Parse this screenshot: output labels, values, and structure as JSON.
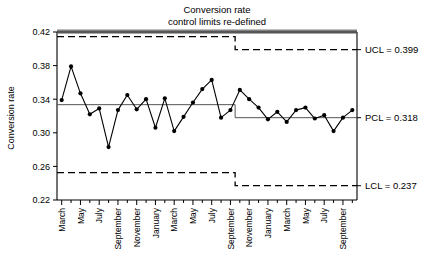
{
  "chart_data": {
    "type": "line",
    "title": "Conversion rate",
    "subtitle": "control limits re-defined",
    "xlabel": "",
    "ylabel": "Conversion rate",
    "ylim": [
      0.22,
      0.42
    ],
    "yticks": [
      0.42,
      0.38,
      0.34,
      0.3,
      0.26,
      0.22
    ],
    "ytick_labels": [
      "0.42",
      "0.38",
      "0.34",
      "0.30",
      "0.26",
      "0.22"
    ],
    "grid": false,
    "legend": "none",
    "x_tick_labels": [
      "March",
      "May",
      "July",
      "September",
      "November",
      "January",
      "March",
      "May",
      "July",
      "September",
      "November",
      "January",
      "March",
      "May",
      "July",
      "September"
    ],
    "x_label_indices": [
      0,
      2,
      4,
      6,
      8,
      10,
      12,
      14,
      16,
      18,
      20,
      22,
      24,
      26,
      28,
      30
    ],
    "n_points": 32,
    "values": [
      0.339,
      0.379,
      0.347,
      0.322,
      0.329,
      0.283,
      0.327,
      0.345,
      0.328,
      0.34,
      0.306,
      0.341,
      0.302,
      0.319,
      0.336,
      0.352,
      0.363,
      0.318,
      0.327,
      0.351,
      0.34,
      0.33,
      0.316,
      0.325,
      0.313,
      0.327,
      0.33,
      0.317,
      0.321,
      0.302,
      0.318,
      0.327
    ],
    "annotations": [
      {
        "name": "ucl",
        "label": "UCL = 0.399",
        "value": 0.399
      },
      {
        "name": "pcl",
        "label": "PCL = 0.318",
        "value": 0.318
      },
      {
        "name": "lcl",
        "label": "LCL = 0.237",
        "value": 0.237
      }
    ],
    "control_phases": [
      {
        "name": "phase-1",
        "start_index": 0,
        "end_index": 19,
        "ucl": 0.4145,
        "pcl": 0.3335,
        "lcl": 0.2525
      },
      {
        "name": "phase-2",
        "start_index": 19,
        "end_index": 31,
        "ucl": 0.399,
        "pcl": 0.318,
        "lcl": 0.237
      }
    ],
    "colors": {
      "line": "#000000",
      "marker": "#000000",
      "center_line": "#555555",
      "limit_line": "#000000",
      "axis": "#000000",
      "top_band": "#6b6b6b"
    }
  }
}
